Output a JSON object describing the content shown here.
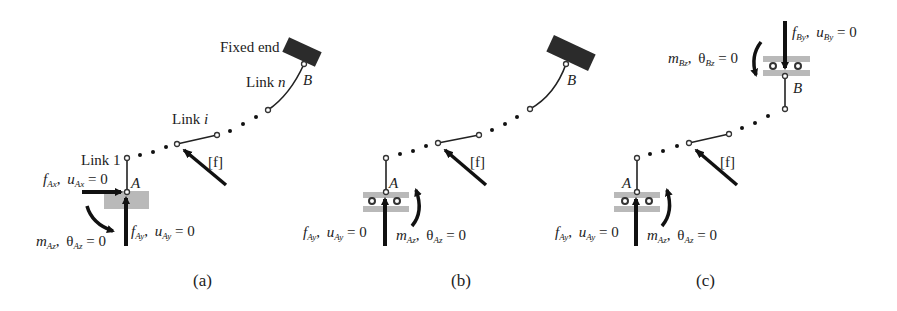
{
  "figure": {
    "panels": [
      {
        "id": "a",
        "caption": "(a)",
        "labels": {
          "fixed_end": "Fixed end",
          "link_n": "Link",
          "link_n_index": "n",
          "link_i": "Link",
          "link_i_index": "i",
          "link_1": "Link 1",
          "point_a": "A",
          "point_b": "B",
          "load": "[f]",
          "fax": {
            "sym": "f",
            "sub": "Ax",
            "sep": ",",
            "disp": "u",
            "disp_sub": "Ax",
            "eq": " = 0"
          },
          "fay": {
            "sym": "f",
            "sub": "Ay",
            "sep": ",",
            "disp": "u",
            "disp_sub": "Ay",
            "eq": " = 0"
          },
          "maz": {
            "sym": "m",
            "sub": "Az",
            "sep": ",",
            "disp": "θ",
            "disp_sub": "Az",
            "eq": " = 0"
          }
        },
        "support_A": "fixed (gray block)",
        "support_B": "fixed end (dark block)"
      },
      {
        "id": "b",
        "caption": "(b)",
        "labels": {
          "point_a": "A",
          "point_b": "B",
          "load": "[f]",
          "fay": {
            "sym": "f",
            "sub": "Ay",
            "sep": ",",
            "disp": "u",
            "disp_sub": "Ay",
            "eq": " = 0"
          },
          "maz": {
            "sym": "m",
            "sub": "Az",
            "sep": ",",
            "disp": "θ",
            "disp_sub": "Az",
            "eq": " = 0"
          }
        },
        "support_A": "roller guide (vertical)",
        "support_B": "fixed end (dark block)"
      },
      {
        "id": "c",
        "caption": "(c)",
        "labels": {
          "point_a": "A",
          "point_b": "B",
          "load": "[f]",
          "fby": {
            "sym": "f",
            "sub": "By",
            "sep": ",",
            "disp": "u",
            "disp_sub": "By",
            "eq": " = 0"
          },
          "mbz": {
            "sym": "m",
            "sub": "Bz",
            "sep": ",",
            "disp": "θ",
            "disp_sub": "Bz",
            "eq": " = 0"
          },
          "fay": {
            "sym": "f",
            "sub": "Ay",
            "sep": ",",
            "disp": "u",
            "disp_sub": "Ay",
            "eq": " = 0"
          },
          "maz": {
            "sym": "m",
            "sub": "Az",
            "sep": ",",
            "disp": "θ",
            "disp_sub": "Az",
            "eq": " = 0"
          }
        },
        "support_A": "roller guide (vertical)",
        "support_B": "roller guide (vertical)"
      }
    ],
    "colors": {
      "ink": "#222222",
      "support_gray": "#b9b9b9",
      "fixed_block": "#2b2b2b",
      "background": "#ffffff"
    }
  }
}
